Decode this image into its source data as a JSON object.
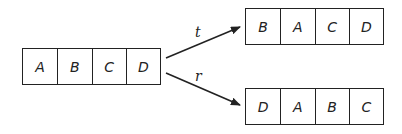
{
  "source": {
    "cells": [
      "A",
      "B",
      "C",
      "D"
    ]
  },
  "targets": [
    {
      "label": "t",
      "cells": [
        "B",
        "A",
        "C",
        "D"
      ]
    },
    {
      "label": "r",
      "cells": [
        "D",
        "A",
        "B",
        "C"
      ]
    }
  ]
}
